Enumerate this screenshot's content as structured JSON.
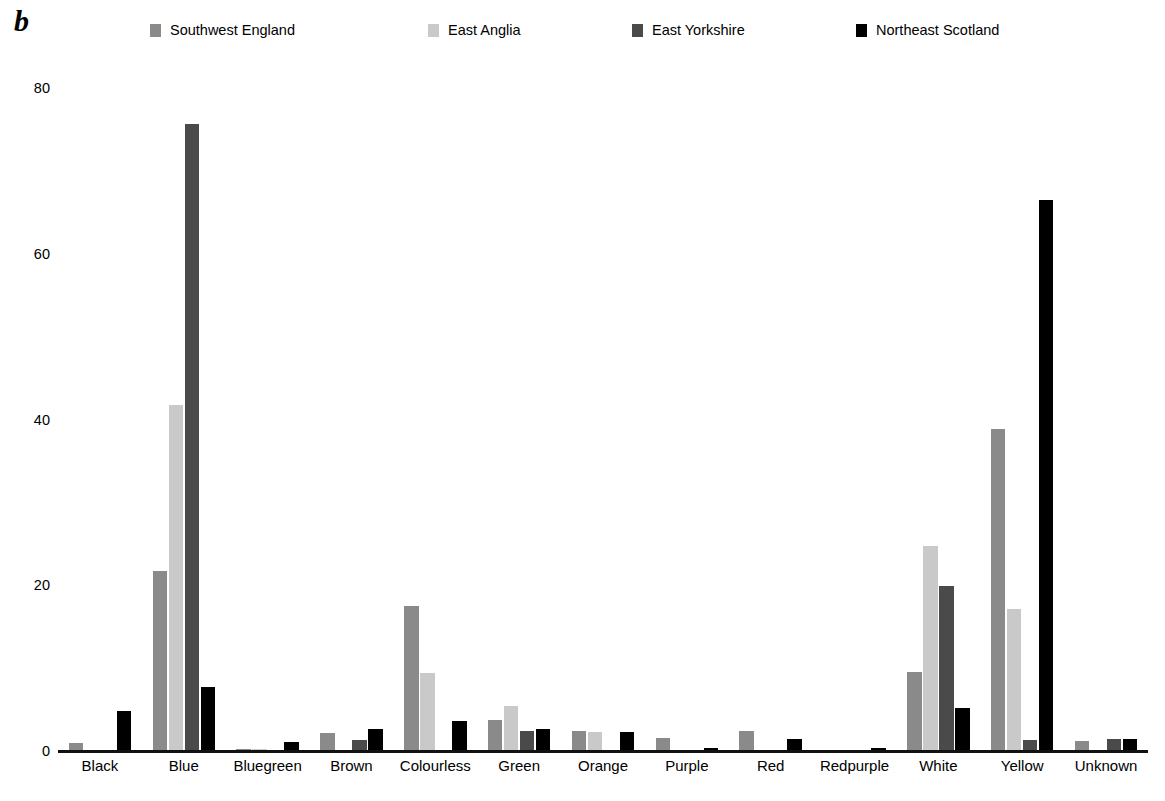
{
  "panel": {
    "letter": "b"
  },
  "legend": {
    "items": [
      {
        "label": "Southwest England",
        "color": "#8a8a8a"
      },
      {
        "label": "East Anglia",
        "color": "#c9c9c9"
      },
      {
        "label": "East Yorkshire",
        "color": "#4a4a4a"
      },
      {
        "label": "Northeast Scotland",
        "color": "#000000"
      }
    ]
  },
  "axis": {
    "y_ticks": [
      "0",
      "20",
      "40",
      "60",
      "80"
    ]
  },
  "chart_data": {
    "type": "bar",
    "title": "",
    "xlabel": "",
    "ylabel": "",
    "ylim": [
      0,
      80
    ],
    "yticks": [
      0,
      20,
      40,
      60,
      80
    ],
    "grid": false,
    "legend_position": "top",
    "categories": [
      "Black",
      "Blue",
      "Bluegreen",
      "Brown",
      "Colourless",
      "Green",
      "Orange",
      "Purple",
      "Red",
      "Redpurple",
      "White",
      "Yellow",
      "Unknown"
    ],
    "series": [
      {
        "name": "Southwest England",
        "color": "#8a8a8a",
        "values": [
          1.0,
          21.7,
          0.3,
          2.2,
          17.5,
          3.7,
          2.4,
          1.6,
          2.4,
          0.0,
          9.5,
          38.8,
          1.2
        ]
      },
      {
        "name": "East Anglia",
        "color": "#c9c9c9",
        "values": [
          0.0,
          41.7,
          0.2,
          0.0,
          9.4,
          5.4,
          2.3,
          0.0,
          0.0,
          0.0,
          24.7,
          17.1,
          0.0
        ]
      },
      {
        "name": "East Yorkshire",
        "color": "#4a4a4a",
        "values": [
          0.0,
          75.6,
          0.0,
          1.3,
          0.0,
          2.4,
          0.0,
          0.0,
          0.0,
          0.0,
          19.9,
          1.3,
          1.4
        ]
      },
      {
        "name": "Northeast Scotland",
        "color": "#000000",
        "values": [
          4.8,
          7.7,
          1.1,
          2.6,
          3.6,
          2.7,
          2.3,
          0.4,
          1.5,
          0.4,
          5.2,
          66.5,
          1.4
        ]
      }
    ]
  }
}
